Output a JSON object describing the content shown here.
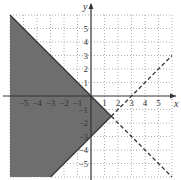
{
  "chart_data": {
    "type": "line",
    "title": "",
    "xlabel": "x",
    "ylabel": "y",
    "xlim": [
      -6,
      6
    ],
    "ylim": [
      -6,
      6
    ],
    "grid": true,
    "grid_style": "dotted",
    "x_ticks": [
      -5,
      -4,
      -3,
      -2,
      -1,
      1,
      2,
      3,
      4,
      5
    ],
    "y_ticks": [
      5,
      4,
      3,
      2,
      1,
      -1,
      -2,
      -3,
      -4,
      -5
    ],
    "x_tick_labels": [
      "−5",
      "−4",
      "−3",
      "−2",
      "−1",
      "1",
      "2",
      "3",
      "4",
      "5"
    ],
    "y_tick_labels": [
      "5",
      "4",
      "3",
      "2",
      "1",
      "−1",
      "−2",
      "−3",
      "−4",
      "−5"
    ],
    "series": [
      {
        "name": "y = -x",
        "equation": "y = -x",
        "solid_segment": [
          [
            -6,
            6
          ],
          [
            1.5,
            -1.5
          ]
        ],
        "dashed_segment": [
          [
            1.5,
            -1.5
          ],
          [
            6,
            -6
          ]
        ]
      },
      {
        "name": "y = x - 3",
        "equation": "y = x - 3",
        "solid_segment": [
          [
            -3,
            -6
          ],
          [
            1.5,
            -1.5
          ]
        ],
        "dashed_segment": [
          [
            1.5,
            -1.5
          ],
          [
            6,
            3
          ]
        ]
      }
    ],
    "shaded_region": {
      "description": "y <= -x and y >= x - 3",
      "vertices": [
        [
          -6,
          6
        ],
        [
          1.5,
          -1.5
        ],
        [
          -3,
          -6
        ],
        [
          -6,
          -6
        ]
      ],
      "color": "#6e6e6e"
    },
    "intersection": [
      1.5,
      -1.5
    ],
    "colors": {
      "shade": "#6e6e6e",
      "line": "#333333",
      "grid": "#9a9a9a",
      "axis": "#333333"
    }
  }
}
